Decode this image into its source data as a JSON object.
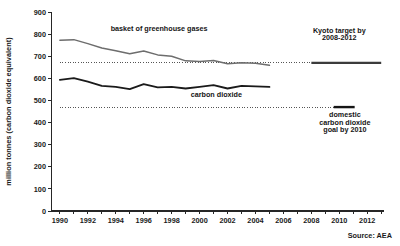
{
  "chart_data": {
    "type": "line",
    "title": "",
    "xlabel": "",
    "ylabel": "million tonnes (carbon dioxide equivalent)",
    "xlim": [
      1989.4,
      2013.2
    ],
    "ylim": [
      0,
      900
    ],
    "grid": false,
    "legend_position": "inline-annotations",
    "yticks": [
      0,
      100,
      200,
      300,
      400,
      500,
      600,
      700,
      800,
      900
    ],
    "ytick_labels": [
      "0",
      "100",
      "200",
      "300",
      "400",
      "500",
      "600",
      "700",
      "800",
      "900"
    ],
    "xticks": [
      1990,
      1991,
      1992,
      1993,
      1994,
      1995,
      1996,
      1997,
      1998,
      1999,
      2000,
      2001,
      2002,
      2003,
      2004,
      2005,
      2006,
      2007,
      2008,
      2009,
      2010,
      2011,
      2012,
      2013
    ],
    "xtick_labels_shown": [
      "1990",
      "1992",
      "1994",
      "1996",
      "1998",
      "2000",
      "2002",
      "2004",
      "2006",
      "2008",
      "2010",
      "2012"
    ],
    "x": [
      1990,
      1991,
      1992,
      1993,
      1994,
      1995,
      1996,
      1997,
      1998,
      1999,
      2000,
      2001,
      2002,
      2003,
      2004,
      2005
    ],
    "series": [
      {
        "name": "basket of greenhouse gases",
        "color": "#6d6d6d",
        "values": [
          772,
          775,
          757,
          737,
          725,
          711,
          724,
          706,
          700,
          679,
          676,
          681,
          666,
          670,
          668,
          659
        ]
      },
      {
        "name": "carbon dioxide",
        "color": "#1a1a1a",
        "values": [
          593,
          601,
          585,
          566,
          561,
          551,
          574,
          559,
          561,
          554,
          561,
          569,
          554,
          566,
          564,
          561
        ]
      }
    ],
    "reference_lines": [
      {
        "name": "kyoto-target-level",
        "value": 670,
        "style": "dotted",
        "x_from": 1990,
        "x_to": 2008
      },
      {
        "name": "domestic-co2-goal-level",
        "value": 470,
        "style": "dotted",
        "x_from": 1990,
        "x_to": 2009.6
      }
    ],
    "target_segments": [
      {
        "name": "kyoto-target",
        "value": 670,
        "style": "solid",
        "x_from": 2008,
        "x_to": 2013
      },
      {
        "name": "domestic-co2-goal",
        "value": 470,
        "style": "solid",
        "x_from": 2009.6,
        "x_to": 2011.1
      }
    ],
    "annotations": [
      {
        "name": "basket-label",
        "text": "basket of greenhouse gases",
        "x": 1997.1,
        "y": 812
      },
      {
        "name": "carbon-dioxide-label",
        "text": "carbon dioxide",
        "x": 2001.2,
        "y": 516
      },
      {
        "name": "kyoto-label-line1",
        "text": "Kyoto target by",
        "x": 2010.0,
        "y": 806
      },
      {
        "name": "kyoto-label-line2",
        "text": "2008-2012",
        "x": 2010.0,
        "y": 772
      },
      {
        "name": "domestic-label-line1",
        "text": "domestic",
        "x": 2010.4,
        "y": 424
      },
      {
        "name": "domestic-label-line2",
        "text": "carbon dioxide",
        "x": 2010.4,
        "y": 390
      },
      {
        "name": "domestic-label-line3",
        "text": "goal by 2010",
        "x": 2010.4,
        "y": 356
      }
    ],
    "source": "Source: AEA"
  }
}
